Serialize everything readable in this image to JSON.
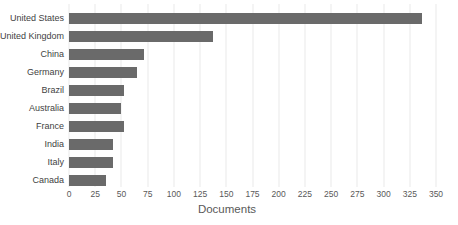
{
  "chart_data": {
    "type": "bar",
    "orientation": "horizontal",
    "title": "",
    "xlabel": "Documents",
    "ylabel": "",
    "categories": [
      "United States",
      "United Kingdom",
      "China",
      "Germany",
      "Brazil",
      "Australia",
      "France",
      "India",
      "Italy",
      "Canada"
    ],
    "values": [
      337,
      137,
      72,
      65,
      52,
      50,
      52,
      42,
      42,
      35
    ],
    "xlim": [
      0,
      350
    ],
    "xticks": [
      0,
      25,
      50,
      75,
      100,
      125,
      150,
      175,
      200,
      225,
      250,
      275,
      300,
      325,
      350
    ],
    "grid": "vertical-gridlines-on",
    "legend": "none",
    "colors": {
      "bar": "#6a6a6a",
      "gridline": "#e9e9e9",
      "tick_label": "#595959",
      "category_label": "#3f3f3f",
      "axis_title": "#595959",
      "background": "#ffffff"
    }
  }
}
